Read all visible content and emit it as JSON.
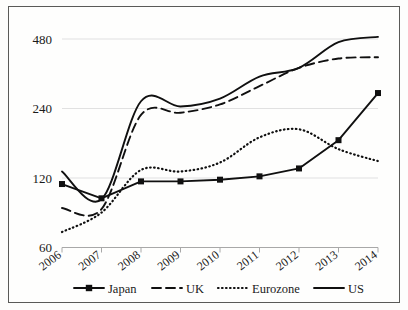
{
  "chart_data": {
    "type": "line",
    "title": "",
    "subtitle": "",
    "xlabel": "",
    "ylabel": "",
    "yscale": "log",
    "ylim": [
      60,
      560
    ],
    "grid": true,
    "legend_position": "bottom",
    "categories": [
      "2006",
      "2007",
      "2008",
      "2009",
      "2010",
      "2011",
      "2012",
      "2013",
      "2014"
    ],
    "ytick_labels": [
      "480",
      "240",
      "120",
      "60"
    ],
    "ytick_values": [
      480,
      240,
      120,
      60
    ],
    "series": [
      {
        "name": "Japan",
        "style": "solid-marker",
        "marker": "square",
        "color": "#101010",
        "values": [
          113,
          98,
          116,
          116,
          118,
          122,
          132,
          175,
          280
        ]
      },
      {
        "name": "UK",
        "style": "dashed",
        "marker": "none",
        "color": "#101010",
        "values": [
          89,
          88,
          225,
          230,
          250,
          300,
          360,
          395,
          400
        ]
      },
      {
        "name": "Eurozone",
        "style": "dotted",
        "marker": "none",
        "color": "#101010",
        "values": [
          70,
          85,
          130,
          128,
          140,
          180,
          195,
          160,
          142
        ]
      },
      {
        "name": "US",
        "style": "solid",
        "marker": "none",
        "color": "#101010",
        "values": [
          128,
          97,
          258,
          245,
          265,
          330,
          360,
          465,
          490
        ]
      }
    ]
  },
  "legend": {
    "items": [
      {
        "label": "Japan",
        "style": "solid-marker"
      },
      {
        "label": "UK",
        "style": "dashed"
      },
      {
        "label": "Eurozone",
        "style": "dotted"
      },
      {
        "label": "US",
        "style": "solid"
      }
    ]
  }
}
